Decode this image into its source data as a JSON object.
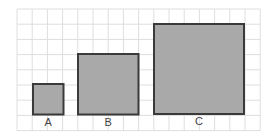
{
  "diagram": {
    "grid": {
      "x0": 17,
      "y0": 9,
      "cell": 15.2,
      "cols": 16,
      "rows": 8,
      "color": "#dedede"
    },
    "fill_color": "#a9a9a9",
    "stroke_color": "#3a3a3a",
    "squares": [
      {
        "label": "A",
        "x": 33,
        "y": 84,
        "size": 30.5,
        "grid_units": 2
      },
      {
        "label": "B",
        "x": 78,
        "y": 54,
        "size": 60.5,
        "grid_units": 4
      },
      {
        "label": "C",
        "x": 154,
        "y": 24,
        "size": 90,
        "grid_units": 6
      }
    ]
  }
}
